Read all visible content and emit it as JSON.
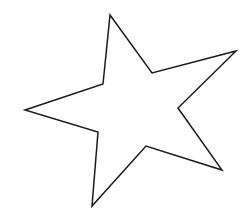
{
  "page": {
    "background_color": "#ffffff",
    "width": 251,
    "height": 216
  },
  "drawing": {
    "name": "five-pointed-star-outline",
    "description": "Hand-drawn style five-pointed star outline, irregular/skewed, black line on white background",
    "stroke_color": "#1a1a1a",
    "fill_color": "none",
    "stroke_width": 1.5,
    "viewbox": "0 0 251 216",
    "points_label": "5",
    "vertices": [
      {
        "name": "tip-top",
        "kind": "outer",
        "x": 110,
        "y": 15
      },
      {
        "name": "notch-top-right",
        "kind": "inner",
        "x": 152,
        "y": 73
      },
      {
        "name": "tip-right-upper",
        "kind": "outer",
        "x": 236,
        "y": 51
      },
      {
        "name": "notch-right",
        "kind": "inner",
        "x": 178,
        "y": 108
      },
      {
        "name": "tip-right-lower",
        "kind": "outer",
        "x": 222,
        "y": 170
      },
      {
        "name": "notch-bottom",
        "kind": "inner",
        "x": 146,
        "y": 146
      },
      {
        "name": "tip-bottom-left",
        "kind": "outer",
        "x": 92,
        "y": 206
      },
      {
        "name": "notch-bottom-left",
        "kind": "inner",
        "x": 98,
        "y": 132
      },
      {
        "name": "tip-left",
        "kind": "outer",
        "x": 25,
        "y": 110
      },
      {
        "name": "notch-top-left",
        "kind": "inner",
        "x": 103,
        "y": 84
      }
    ],
    "path_d": "M 110 15 L 152 73 L 236 51 L 178 108 L 222 170 L 146 146 L 92 206 L 98 132 L 25 110 L 103 84 Z"
  }
}
